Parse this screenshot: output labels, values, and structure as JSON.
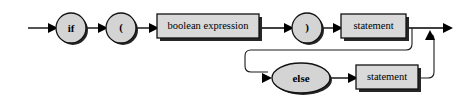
{
  "diagram": {
    "type": "railroad-syntax-diagram",
    "background_color": "#ffffff",
    "line_color": "#000000",
    "box_fill_color": "#d9d9d9",
    "round_fill_color": "#d4d4d4",
    "shadow_color": "#262626",
    "nodes": [
      {
        "id": "entry",
        "kind": "entry-arrow",
        "label": ""
      },
      {
        "id": "if",
        "kind": "terminal-circle",
        "label": "if"
      },
      {
        "id": "lparen",
        "kind": "terminal-circle",
        "label": "("
      },
      {
        "id": "boolean-expression",
        "kind": "nonterminal-box",
        "label": "boolean expression"
      },
      {
        "id": "rparen",
        "kind": "terminal-circle",
        "label": ")"
      },
      {
        "id": "statement-then",
        "kind": "nonterminal-box",
        "label": "statement"
      },
      {
        "id": "else",
        "kind": "terminal-ellipse",
        "label": "else"
      },
      {
        "id": "statement-else",
        "kind": "nonterminal-box",
        "label": "statement"
      },
      {
        "id": "exit",
        "kind": "exit-arrow",
        "label": ""
      }
    ],
    "paths": [
      {
        "from": "entry",
        "to": "if"
      },
      {
        "from": "if",
        "to": "lparen"
      },
      {
        "from": "lparen",
        "to": "boolean-expression"
      },
      {
        "from": "boolean-expression",
        "to": "rparen"
      },
      {
        "from": "rparen",
        "to": "statement-then"
      },
      {
        "from": "statement-then",
        "to": "exit"
      },
      {
        "from": "statement-then",
        "to": "else",
        "kind": "optional-branch"
      },
      {
        "from": "else",
        "to": "statement-else"
      },
      {
        "from": "statement-else",
        "to": "exit",
        "kind": "rejoin"
      }
    ]
  }
}
